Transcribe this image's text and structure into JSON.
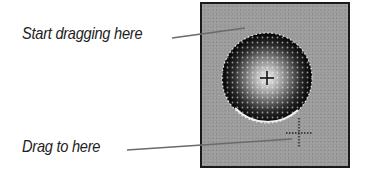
{
  "labels": {
    "start": "Start dragging here",
    "end": "Drag to here"
  },
  "panel": {
    "background": "#9a9a9a",
    "border": "#1a1a1a"
  },
  "brush": {
    "shape": "soft-round-brush-circle",
    "center_x": 267,
    "center_y": 78,
    "radius": 45,
    "start_cursor": "crosshair-icon",
    "end_cursor": "dotted-crosshair-icon",
    "end_x": 299,
    "end_y": 133
  }
}
